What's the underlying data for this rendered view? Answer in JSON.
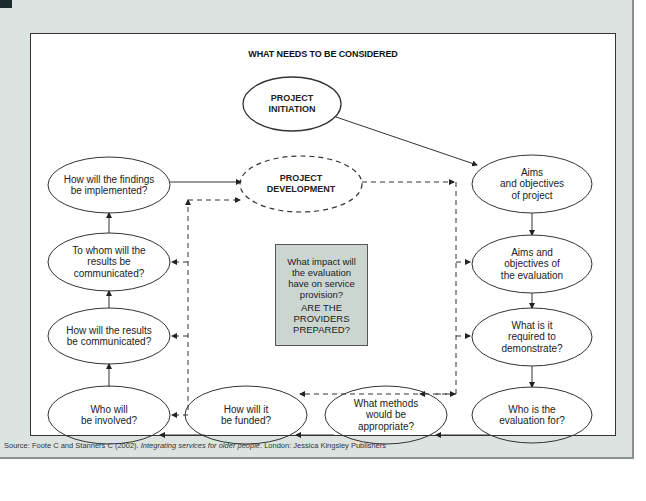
{
  "diagram": {
    "title": "WHAT NEEDS TO BE CONSIDERED",
    "nodes": [
      {
        "id": "project-initiation",
        "label": "PROJECT\nINITIATION",
        "style": "solid-bold"
      },
      {
        "id": "project-development",
        "label": "PROJECT\nDEVELOPMENT",
        "style": "dashed-bold"
      },
      {
        "id": "aims-project",
        "label": "Aims\nand objectives\nof project"
      },
      {
        "id": "aims-evaluation",
        "label": "Aims and\nobjectives of\nthe evaluation"
      },
      {
        "id": "required-demonstrate",
        "label": "What is it\nrequired to\ndemonstrate?"
      },
      {
        "id": "evaluation-for",
        "label": "Who is the\nevaluation for?"
      },
      {
        "id": "methods",
        "label": "What methods\nwould be\nappropriate?"
      },
      {
        "id": "funded",
        "label": "How will it\nbe funded?"
      },
      {
        "id": "involved",
        "label": "Who will\nbe involved?"
      },
      {
        "id": "results-communicated",
        "label": "How will the results\nbe communicated?"
      },
      {
        "id": "to-whom",
        "label": "To whom will the\nresults be\ncommunicated?"
      },
      {
        "id": "findings-implemented",
        "label": "How will the findings\nbe implemented?"
      }
    ],
    "center_box": {
      "question": "What impact will\nthe evaluation\nhave on service\nprovision?",
      "emphasis": "ARE THE\nPROVIDERS\nPREPARED?"
    },
    "edges": [
      {
        "from": "project-initiation",
        "to": "aims-project",
        "style": "solid"
      },
      {
        "from": "aims-project",
        "to": "aims-evaluation",
        "style": "solid"
      },
      {
        "from": "aims-evaluation",
        "to": "required-demonstrate",
        "style": "solid"
      },
      {
        "from": "required-demonstrate",
        "to": "evaluation-for",
        "style": "solid"
      },
      {
        "from": "evaluation-for",
        "to": "methods",
        "style": "solid"
      },
      {
        "from": "methods",
        "to": "funded",
        "style": "solid"
      },
      {
        "from": "funded",
        "to": "involved",
        "style": "solid"
      },
      {
        "from": "involved",
        "to": "results-communicated",
        "style": "solid"
      },
      {
        "from": "results-communicated",
        "to": "to-whom",
        "style": "solid"
      },
      {
        "from": "to-whom",
        "to": "findings-implemented",
        "style": "solid"
      },
      {
        "from": "findings-implemented",
        "to": "project-development",
        "style": "solid"
      },
      {
        "from": "project-development",
        "to": "right-dashed-loop",
        "style": "dashed"
      },
      {
        "from": "left-dashed-loop",
        "to": "project-development",
        "style": "dashed"
      }
    ]
  },
  "source": {
    "prefix": "Source: Foote C and Stanners C (2002). ",
    "title": "Integrating services for older people",
    "suffix": ". London: Jessica Kingsley Publishers"
  }
}
